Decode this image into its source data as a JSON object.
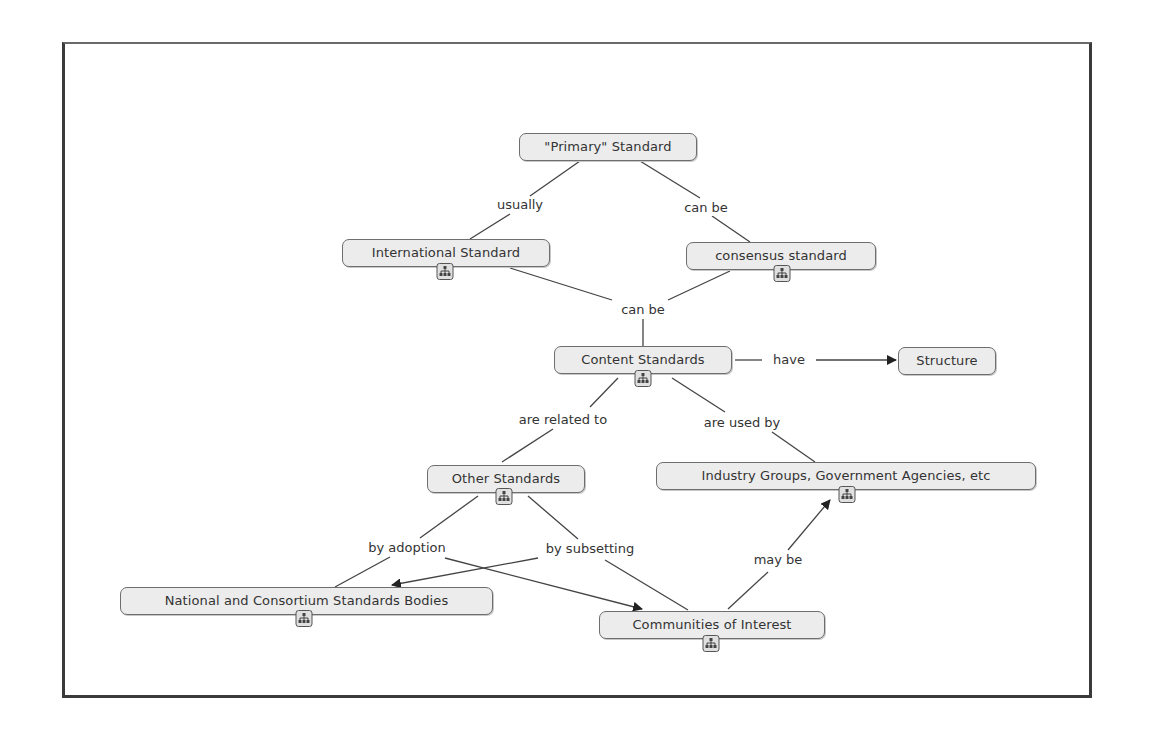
{
  "diagram": {
    "type": "concept-map",
    "nodes": {
      "primary": {
        "label": "\"Primary\" Standard",
        "has_submap": false
      },
      "international": {
        "label": "International Standard",
        "has_submap": true
      },
      "consensus": {
        "label": "consensus standard",
        "has_submap": true
      },
      "content": {
        "label": "Content Standards",
        "has_submap": true
      },
      "structure": {
        "label": "Structure",
        "has_submap": false
      },
      "other": {
        "label": "Other Standards",
        "has_submap": true
      },
      "industry": {
        "label": "Industry Groups, Government Agencies, etc",
        "has_submap": true
      },
      "national": {
        "label": "National and Consortium Standards Bodies",
        "has_submap": true
      },
      "communities": {
        "label": "Communities of Interest",
        "has_submap": true
      }
    },
    "links": {
      "usually": {
        "label": "usually",
        "from": "primary",
        "to": "international"
      },
      "can_be_1": {
        "label": "can be",
        "from": "primary",
        "to": "consensus"
      },
      "can_be_2": {
        "label": "can be",
        "from": [
          "international",
          "consensus"
        ],
        "to": "content"
      },
      "have": {
        "label": "have",
        "from": "content",
        "to": "structure"
      },
      "are_related_to": {
        "label": "are related to",
        "from": "content",
        "to": "other"
      },
      "are_used_by": {
        "label": "are used by",
        "from": "content",
        "to": "industry"
      },
      "by_adoption": {
        "label": "by adoption",
        "from": "other",
        "to": [
          "national",
          "communities"
        ]
      },
      "by_subsetting": {
        "label": "by subsetting",
        "from": "other",
        "to": [
          "communities",
          "national"
        ]
      },
      "may_be": {
        "label": "may be",
        "from": "communities",
        "to": "industry"
      }
    },
    "submap_icon": "hierarchy-icon",
    "colors": {
      "node_fill": "#ececec",
      "node_border": "#6e6e6e",
      "line": "#444444",
      "frame": "#3a3a3a"
    }
  }
}
